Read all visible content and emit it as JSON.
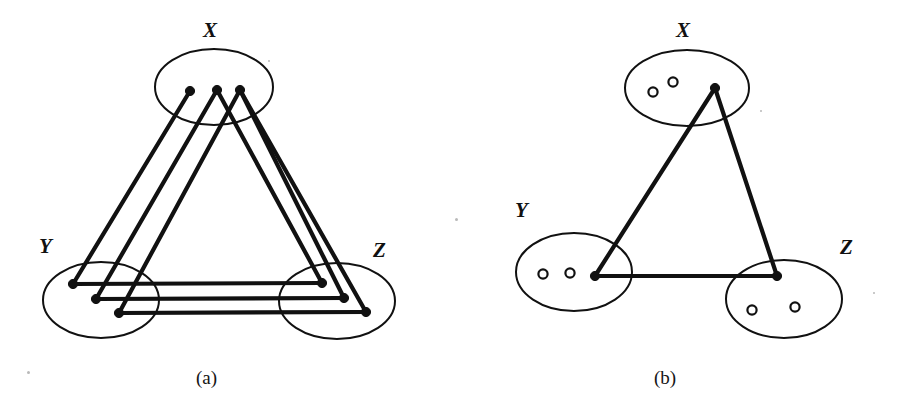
{
  "figure": {
    "width": 916,
    "height": 414,
    "background": "#ffffff",
    "ink_color": "#111111",
    "panels": [
      {
        "id": "a",
        "caption": "(a)",
        "caption_pos": {
          "x": 196,
          "y": 368
        },
        "sets": [
          {
            "name": "X",
            "label": "X",
            "label_pos": {
              "x": 203,
              "y": 20
            },
            "ellipse": {
              "cx": 214,
              "cy": 87,
              "rx": 59,
              "ry": 38
            },
            "vertices": [
              {
                "id": "x1",
                "x": 190,
                "y": 91,
                "filled": true
              },
              {
                "id": "x2",
                "x": 217,
                "y": 90,
                "filled": true
              },
              {
                "id": "x3",
                "x": 240,
                "y": 90,
                "filled": true
              }
            ]
          },
          {
            "name": "Y",
            "label": "Y",
            "label_pos": {
              "x": 39,
              "y": 236
            },
            "ellipse": {
              "cx": 101,
              "cy": 300,
              "rx": 58,
              "ry": 38
            },
            "vertices": [
              {
                "id": "y1",
                "x": 73,
                "y": 284,
                "filled": true
              },
              {
                "id": "y2",
                "x": 96,
                "y": 299,
                "filled": true
              },
              {
                "id": "y3",
                "x": 119,
                "y": 313,
                "filled": true
              }
            ]
          },
          {
            "name": "Z",
            "label": "Z",
            "label_pos": {
              "x": 373,
              "y": 240
            },
            "ellipse": {
              "cx": 337,
              "cy": 301,
              "rx": 58,
              "ry": 38
            },
            "vertices": [
              {
                "id": "z1",
                "x": 322,
                "y": 283,
                "filled": true
              },
              {
                "id": "z2",
                "x": 344,
                "y": 298,
                "filled": true
              },
              {
                "id": "z3",
                "x": 366,
                "y": 312,
                "filled": true
              }
            ]
          }
        ],
        "edges": [
          {
            "from": "x1",
            "to": "y1"
          },
          {
            "from": "x2",
            "to": "y2"
          },
          {
            "from": "x3",
            "to": "y3"
          },
          {
            "from": "x2",
            "to": "z1"
          },
          {
            "from": "x3",
            "to": "z2"
          },
          {
            "from": "x3",
            "to": "z3"
          },
          {
            "from": "y1",
            "to": "z1"
          },
          {
            "from": "y2",
            "to": "z2"
          },
          {
            "from": "y3",
            "to": "z3"
          }
        ]
      },
      {
        "id": "b",
        "caption": "(b)",
        "caption_pos": {
          "x": 196,
          "y": 368
        },
        "sets": [
          {
            "name": "X",
            "label": "X",
            "label_pos": {
              "x": 218,
              "y": 20
            },
            "ellipse": {
              "cx": 229,
              "cy": 88,
              "rx": 62,
              "ry": 38
            },
            "vertices": [
              {
                "id": "x1",
                "x": 195,
                "y": 92,
                "filled": false
              },
              {
                "id": "x2",
                "x": 215,
                "y": 82,
                "filled": false
              },
              {
                "id": "x3",
                "x": 257,
                "y": 88,
                "filled": true
              }
            ]
          },
          {
            "name": "Y",
            "label": "Y",
            "label_pos": {
              "x": 57,
              "y": 200
            },
            "ellipse": {
              "cx": 116,
              "cy": 272,
              "rx": 58,
              "ry": 39
            },
            "vertices": [
              {
                "id": "y1",
                "x": 85,
                "y": 274,
                "filled": false
              },
              {
                "id": "y2",
                "x": 112,
                "y": 273,
                "filled": false
              },
              {
                "id": "y3",
                "x": 137,
                "y": 276,
                "filled": true
              }
            ]
          },
          {
            "name": "Z",
            "label": "Z",
            "label_pos": {
              "x": 382,
              "y": 237
            },
            "ellipse": {
              "cx": 326,
              "cy": 299,
              "rx": 58,
              "ry": 39
            },
            "vertices": [
              {
                "id": "z1",
                "x": 294,
                "y": 310,
                "filled": false
              },
              {
                "id": "z2",
                "x": 337,
                "y": 307,
                "filled": false
              },
              {
                "id": "z3",
                "x": 319,
                "y": 276,
                "filled": true
              }
            ]
          }
        ],
        "edges": [
          {
            "from": "x3",
            "to": "y3"
          },
          {
            "from": "x3",
            "to": "z3"
          },
          {
            "from": "y3",
            "to": "z3"
          }
        ]
      }
    ],
    "style": {
      "ellipse_stroke_width": 2.0,
      "edge_stroke_width": 4.2,
      "filled_vertex_radius": 4.6,
      "open_vertex_radius": 4.6,
      "open_vertex_stroke_width": 2.2
    }
  },
  "specks": [
    {
      "x": 268,
      "y": 60,
      "d": 2
    },
    {
      "x": 455,
      "y": 218,
      "d": 3
    },
    {
      "x": 27,
      "y": 371,
      "d": 3
    },
    {
      "x": 760,
      "y": 110,
      "d": 2
    },
    {
      "x": 873,
      "y": 292,
      "d": 2
    }
  ]
}
